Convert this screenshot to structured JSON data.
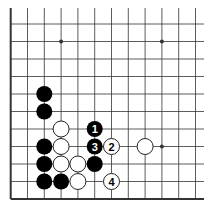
{
  "diagram": {
    "type": "go-board-fragment",
    "grid": {
      "columns": 12,
      "rows": 11,
      "origin_x": 10.7,
      "origin_y": 24,
      "spacing_x": 16.8,
      "spacing_y": 17.5,
      "top_y": 8,
      "right_x": 204,
      "left_edge_is_border": true,
      "bottom_edge_is_border": true
    },
    "colors": {
      "line": "#333333",
      "black_stone": "#000000",
      "white_stone": "#ffffff",
      "white_stone_outline": "#222222"
    },
    "star_points": [
      {
        "col": 3,
        "row": 1
      },
      {
        "col": 9,
        "row": 1
      },
      {
        "col": 9,
        "row": 7
      }
    ],
    "stones": [
      {
        "color": "black",
        "col": 2,
        "row": 4,
        "label": ""
      },
      {
        "color": "black",
        "col": 2,
        "row": 5,
        "label": ""
      },
      {
        "color": "black",
        "col": 2,
        "row": 7,
        "label": ""
      },
      {
        "color": "black",
        "col": 2,
        "row": 8,
        "label": ""
      },
      {
        "color": "black",
        "col": 2,
        "row": 9,
        "label": ""
      },
      {
        "color": "black",
        "col": 3,
        "row": 9,
        "label": ""
      },
      {
        "color": "black",
        "col": 5,
        "row": 6,
        "label": "1"
      },
      {
        "color": "black",
        "col": 5,
        "row": 7,
        "label": "3"
      },
      {
        "color": "black",
        "col": 5,
        "row": 8,
        "label": ""
      },
      {
        "color": "white",
        "col": 3,
        "row": 6,
        "label": ""
      },
      {
        "color": "white",
        "col": 3,
        "row": 7,
        "label": ""
      },
      {
        "color": "white",
        "col": 3,
        "row": 8,
        "label": ""
      },
      {
        "color": "white",
        "col": 4,
        "row": 8,
        "label": ""
      },
      {
        "color": "white",
        "col": 4,
        "row": 9,
        "label": ""
      },
      {
        "color": "white",
        "col": 6,
        "row": 7,
        "label": "2"
      },
      {
        "color": "white",
        "col": 8,
        "row": 7,
        "label": ""
      },
      {
        "color": "white",
        "col": 6,
        "row": 9,
        "label": "4"
      }
    ]
  }
}
